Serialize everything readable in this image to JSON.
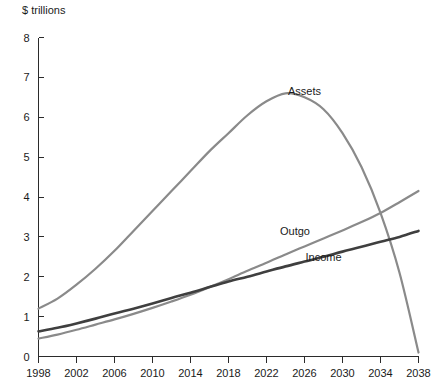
{
  "chart_data": {
    "type": "line",
    "title": "",
    "ylabel": "$ trillions",
    "xlabel": "",
    "ylim": [
      0,
      8
    ],
    "xlim": [
      1998,
      2038
    ],
    "grid": false,
    "legend_position": "inline-annotations",
    "y_ticks": [
      "0",
      "1",
      "2",
      "3",
      "4",
      "5",
      "6",
      "7",
      "8"
    ],
    "x_ticks": [
      "1998",
      "2002",
      "2006",
      "2010",
      "2014",
      "2018",
      "2022",
      "2026",
      "2030",
      "2034",
      "2038"
    ],
    "x": [
      1998,
      2000,
      2002,
      2004,
      2006,
      2008,
      2010,
      2012,
      2014,
      2016,
      2018,
      2020,
      2022,
      2024,
      2026,
      2028,
      2030,
      2032,
      2034,
      2036,
      2038
    ],
    "series": [
      {
        "name": "Assets",
        "color": "#8a8a8a",
        "width": 2.2,
        "label_x": 2026,
        "label_y": 6.55,
        "values": [
          1.2,
          1.45,
          1.8,
          2.2,
          2.65,
          3.15,
          3.65,
          4.15,
          4.65,
          5.15,
          5.6,
          6.05,
          6.4,
          6.6,
          6.5,
          6.2,
          5.6,
          4.75,
          3.6,
          2.1,
          0.1
        ]
      },
      {
        "name": "Outgo",
        "color": "#8a8a8a",
        "width": 2.2,
        "label_x": 2025,
        "label_y": 3.05,
        "values": [
          0.45,
          0.55,
          0.67,
          0.8,
          0.93,
          1.07,
          1.22,
          1.38,
          1.55,
          1.74,
          1.94,
          2.15,
          2.35,
          2.56,
          2.76,
          2.96,
          3.16,
          3.37,
          3.6,
          3.87,
          4.15
        ]
      },
      {
        "name": "Income",
        "color": "#3f3f3f",
        "width": 2.6,
        "label_x": 2028,
        "label_y": 2.4,
        "values": [
          0.63,
          0.72,
          0.83,
          0.95,
          1.08,
          1.2,
          1.33,
          1.47,
          1.6,
          1.74,
          1.88,
          2.0,
          2.13,
          2.26,
          2.38,
          2.5,
          2.63,
          2.75,
          2.88,
          3.0,
          3.15
        ]
      }
    ]
  }
}
